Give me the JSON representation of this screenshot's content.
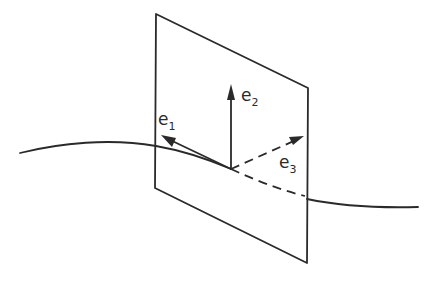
{
  "diagram": {
    "stroke_color": "#2a2a2a",
    "background_color": "#ffffff",
    "plane": {
      "corners": [
        [
          156,
          14
        ],
        [
          308,
          88
        ],
        [
          307,
          263
        ],
        [
          155,
          188
        ]
      ]
    },
    "curve": {
      "left_path": "M20,153 C60,143 110,138 156,146",
      "inside_solid_path": "M156,146 C185,151 210,160 231,169",
      "inside_dashed_path": "M231,169 C255,180 280,190 305,196",
      "right_path": "M307,199 C340,206 380,208 418,207"
    },
    "origin": [
      231,
      169
    ],
    "vectors": [
      {
        "name": "e1",
        "base": "e",
        "sub": "1",
        "tip": [
          161,
          135
        ],
        "style": "solid",
        "label_pos": [
          158,
          125
        ]
      },
      {
        "name": "e2",
        "base": "e",
        "sub": "2",
        "tip": [
          231,
          84
        ],
        "style": "solid",
        "label_pos": [
          241,
          101
        ]
      },
      {
        "name": "e3",
        "base": "e",
        "sub": "3",
        "tip": [
          304,
          136
        ],
        "style": "dashed",
        "label_pos": [
          279,
          168
        ]
      }
    ]
  }
}
